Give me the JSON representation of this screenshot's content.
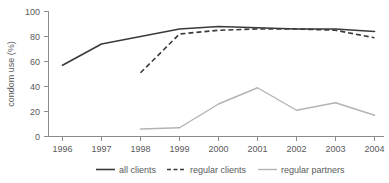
{
  "chart_data": {
    "type": "line",
    "title": "",
    "xlabel": "",
    "ylabel": "condom use (%)",
    "categories": [
      "1996",
      "1997",
      "1998",
      "1999",
      "2000",
      "2001",
      "2002",
      "2003",
      "2004"
    ],
    "x": [
      1996,
      1997,
      1998,
      1999,
      2000,
      2001,
      2002,
      2003,
      2004
    ],
    "ylim": [
      0,
      100
    ],
    "xlim": [
      1996,
      2004
    ],
    "yticks": [
      0,
      20,
      40,
      60,
      80,
      100
    ],
    "ytick_labels": [
      "0",
      "20",
      "40",
      "60",
      "80",
      "100"
    ],
    "xtick_labels": [
      "1996",
      "1997",
      "1998",
      "1999",
      "2000",
      "2001",
      "2002",
      "2003",
      "2004"
    ],
    "grid": false,
    "legend_position": "bottom",
    "series": [
      {
        "name": "all clients",
        "style": "solid",
        "color": "#3a3a3a",
        "x": [
          1996,
          1997,
          1998,
          1999,
          2000,
          2001,
          2002,
          2003,
          2004
        ],
        "values": [
          57,
          74,
          80,
          86,
          88,
          87,
          86,
          86,
          84
        ]
      },
      {
        "name": "regular clients",
        "style": "dashed",
        "color": "#3a3a3a",
        "x": [
          1998,
          1999,
          2000,
          2001,
          2002,
          2003,
          2004
        ],
        "values": [
          51,
          82,
          85,
          86,
          86,
          85,
          79
        ]
      },
      {
        "name": "regular partners",
        "style": "solid",
        "color": "#b3b3b3",
        "x": [
          1998,
          1999,
          2000,
          2001,
          2002,
          2003,
          2004
        ],
        "values": [
          6,
          7,
          26,
          39,
          21,
          27,
          17
        ]
      }
    ]
  },
  "axes": {
    "y_axis_title": "condom use (%)",
    "y_tick_labels": [
      "100",
      "80",
      "60",
      "40",
      "20",
      "0"
    ],
    "x_tick_labels": [
      "1996",
      "1997",
      "1998",
      "1999",
      "2000",
      "2001",
      "2002",
      "2003",
      "2004"
    ]
  },
  "legend": {
    "items": [
      {
        "label": "all clients",
        "icon": "solid-line-icon"
      },
      {
        "label": "regular clients",
        "icon": "dashed-line-icon"
      },
      {
        "label": "regular partners",
        "icon": "solid-line-gray-icon"
      }
    ]
  },
  "colors": {
    "dark_line": "#3a3a3a",
    "gray_line": "#b3b3b3",
    "axis": "#8c8c8c",
    "text": "#58595b",
    "background": "#ffffff"
  }
}
